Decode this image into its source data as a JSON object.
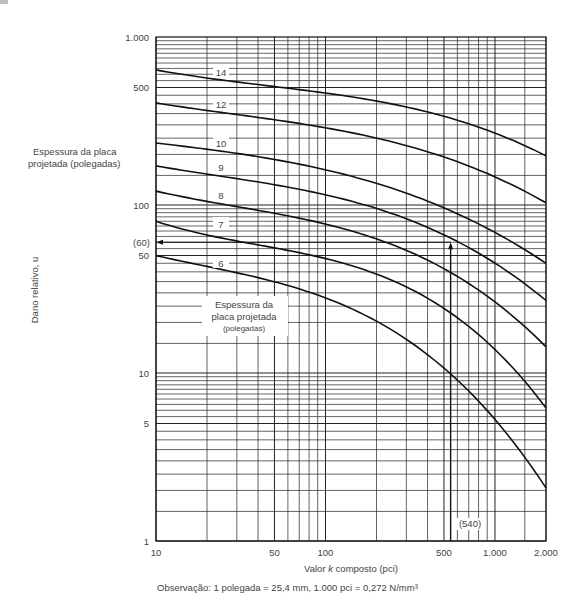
{
  "chart_data": {
    "type": "line",
    "title": "",
    "xlabel": "Valor k composto (pci)",
    "ylabel": "Dano relativo, u",
    "xscale": "log",
    "yscale": "log",
    "xlim": [
      10,
      2000
    ],
    "ylim": [
      1,
      1000
    ],
    "grid": true,
    "x_ticks": [
      10,
      50,
      100,
      500,
      1000,
      2000
    ],
    "x_tick_labels": [
      "10",
      "50",
      "100",
      "500",
      "1.000",
      "2.000"
    ],
    "y_ticks": [
      1,
      5,
      10,
      50,
      100,
      500,
      1000
    ],
    "y_tick_labels": [
      "1",
      "5",
      "10",
      "50",
      "100",
      "500",
      "1.000"
    ],
    "legend_title_outer": "Espessura da placa projetada (polegadas)",
    "legend_title_inner": [
      "Espessura da",
      "placa projetada",
      "(polegadas)"
    ],
    "series": [
      {
        "name": "14",
        "x": [
          10,
          100,
          540,
          2000
        ],
        "values": [
          637,
          464,
          330,
          196
        ]
      },
      {
        "name": "12",
        "x": [
          10,
          100,
          540,
          2000
        ],
        "values": [
          405,
          288,
          188,
          103
        ]
      },
      {
        "name": "10",
        "x": [
          10,
          100,
          540,
          2000
        ],
        "values": [
          234,
          162,
          93,
          45
        ]
      },
      {
        "name": "9",
        "x": [
          10,
          100,
          540,
          2000
        ],
        "values": [
          171,
          115,
          64,
          27
        ]
      },
      {
        "name": "8",
        "x": [
          10,
          100,
          540,
          2000
        ],
        "values": [
          121,
          77,
          40,
          14.3
        ]
      },
      {
        "name": "7",
        "x": [
          10,
          100,
          540,
          2000
        ],
        "values": [
          80,
          48,
          23,
          6.2
        ]
      },
      {
        "name": "6",
        "x": [
          10,
          100,
          540,
          2000
        ],
        "values": [
          50,
          28,
          10,
          2.07
        ]
      }
    ],
    "annotations": [
      {
        "text": "(540)",
        "x": 540,
        "y": 1.6,
        "kind": "x-marker"
      },
      {
        "text": "(60)",
        "x": 10,
        "y": 60,
        "kind": "y-marker"
      },
      {
        "kind": "arrow-path",
        "points": [
          [
            540,
            1
          ],
          [
            540,
            60
          ],
          [
            10,
            60
          ]
        ]
      }
    ],
    "footnote": "Observação: 1 polegada = 25,4 mm, 1.000 pci = 0,272 N/mm³"
  },
  "labels": {
    "ylabel": "Dano relativo, u",
    "xlabel_prefix": "Valor ",
    "xlabel_k": "k",
    "xlabel_suffix": " composto (pci)",
    "legend_outer_1": "Espessura da placa",
    "legend_outer_2": "projetada (polegadas)",
    "legend_inner_1": "Espessura da",
    "legend_inner_2": "placa projetada",
    "legend_inner_3": "(polegadas)",
    "marker_x": "(540)",
    "marker_y": "(60)",
    "footnote": "Observação: 1 polegada = 25,4 mm, 1.000 pci = 0,272 N/mm³"
  }
}
